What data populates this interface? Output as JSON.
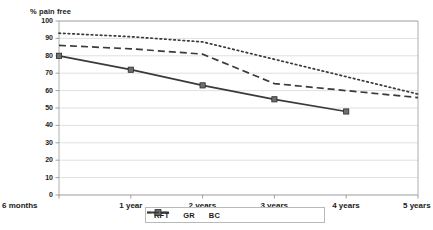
{
  "chart_data": {
    "type": "line",
    "title": "",
    "ylabel": "% pain free",
    "xlabel": "",
    "ylim": [
      0,
      100
    ],
    "yticks": [
      0,
      10,
      20,
      30,
      40,
      50,
      60,
      70,
      80,
      90,
      100
    ],
    "grid": true,
    "legend_position": "bottom",
    "categories": [
      "6 months",
      "1 year",
      "2 years",
      "3 years",
      "4 years",
      "5 years"
    ],
    "series": [
      {
        "name": "RFT",
        "style": "dotted",
        "marker": "none",
        "color": "#3a3a3a",
        "values": [
          93,
          91,
          88,
          78,
          68,
          58
        ]
      },
      {
        "name": "GR",
        "style": "solid",
        "marker": "square",
        "color": "#3a3a3a",
        "values": [
          80,
          72,
          63,
          55,
          48,
          null
        ]
      },
      {
        "name": "BC",
        "style": "dashed",
        "marker": "none",
        "color": "#3a3a3a",
        "values": [
          86,
          84,
          81,
          64,
          60,
          56
        ]
      }
    ]
  },
  "legend": {
    "items": [
      {
        "label": "RFT"
      },
      {
        "label": "GR"
      },
      {
        "label": "BC"
      }
    ]
  },
  "axes": {
    "y_title": "% pain free",
    "y_tick_labels": [
      "100",
      "90",
      "80",
      "70",
      "60",
      "50",
      "40",
      "30",
      "20",
      "10",
      "0"
    ],
    "x_tick_labels": [
      "6 months",
      "1 year",
      "2 years",
      "3 years",
      "4 years",
      "5 years"
    ]
  }
}
